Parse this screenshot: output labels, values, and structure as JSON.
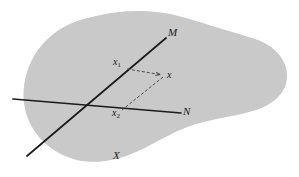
{
  "figure": {
    "type": "geometric-diagram",
    "canvas": {
      "width": 299,
      "height": 177,
      "background": "#ffffff"
    },
    "region": {
      "name": "X",
      "label": "X",
      "label_position": {
        "x": 113,
        "y": 150
      },
      "fill": "#c9c9c9",
      "stroke": "none"
    },
    "lines": [
      {
        "name": "M",
        "label": "M",
        "label_position": {
          "x": 168,
          "y": 27
        },
        "from": {
          "x": 27,
          "y": 156
        },
        "to": {
          "x": 166,
          "y": 38
        },
        "color": "#1b1b1b",
        "width": 1.7,
        "style": "solid"
      },
      {
        "name": "N",
        "label": "N",
        "label_position": {
          "x": 183,
          "y": 106
        },
        "from": {
          "x": 13,
          "y": 99
        },
        "to": {
          "x": 181,
          "y": 113
        },
        "color": "#1b1b1b",
        "width": 1.7,
        "style": "solid"
      }
    ],
    "intersection": {
      "x": 89,
      "y": 105
    },
    "points": [
      {
        "name": "x1",
        "label": "x",
        "subscript": "1",
        "label_position": {
          "x": 113,
          "y": 57
        },
        "at": {
          "x": 127,
          "y": 69
        }
      },
      {
        "name": "x",
        "label": "x",
        "subscript": "",
        "label_position": {
          "x": 167,
          "y": 70
        },
        "at": {
          "x": 163,
          "y": 75
        }
      },
      {
        "name": "x2",
        "label": "x",
        "subscript": "2",
        "label_position": {
          "x": 112,
          "y": 108
        },
        "at": {
          "x": 122,
          "y": 110
        }
      }
    ],
    "connectors": [
      {
        "name": "x1-to-x",
        "from": {
          "x": 127,
          "y": 69
        },
        "to": {
          "x": 163,
          "y": 75
        },
        "style": "dashed",
        "arrow": "end",
        "color": "#3d3d3d",
        "width": 0.9,
        "dash": "3,2"
      },
      {
        "name": "x-to-x2",
        "from": {
          "x": 163,
          "y": 76
        },
        "to": {
          "x": 122,
          "y": 110
        },
        "style": "dashed",
        "arrow": "none",
        "color": "#3d3d3d",
        "width": 0.9,
        "dash": "3,2"
      }
    ]
  }
}
